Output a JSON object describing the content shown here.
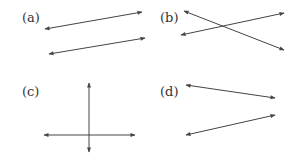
{
  "figure": {
    "line_color": "#444444",
    "text_color": "#333333",
    "panels": [
      {
        "label": "(a)",
        "description": "two parallel lines",
        "label_pos": [
          22,
          22
        ],
        "lines": [
          {
            "x1": 45,
            "y1": 29,
            "x2": 142,
            "y2": 12
          },
          {
            "x1": 49,
            "y1": 54,
            "x2": 145,
            "y2": 38
          }
        ]
      },
      {
        "label": "(b)",
        "description": "two intersecting lines",
        "label_pos": [
          160,
          22
        ],
        "lines": [
          {
            "x1": 184,
            "y1": 11,
            "x2": 284,
            "y2": 50
          },
          {
            "x1": 181,
            "y1": 35,
            "x2": 284,
            "y2": 13
          }
        ]
      },
      {
        "label": "(c)",
        "description": "two perpendicular lines",
        "label_pos": [
          22,
          96
        ],
        "lines": [
          {
            "x1": 89,
            "y1": 83,
            "x2": 89,
            "y2": 152
          },
          {
            "x1": 44,
            "y1": 135,
            "x2": 135,
            "y2": 135
          }
        ]
      },
      {
        "label": "(d)",
        "description": "two non-parallel, non-intersecting (in view) lines",
        "label_pos": [
          160,
          96
        ],
        "lines": [
          {
            "x1": 186,
            "y1": 85,
            "x2": 275,
            "y2": 98
          },
          {
            "x1": 186,
            "y1": 135,
            "x2": 275,
            "y2": 115
          }
        ]
      }
    ]
  }
}
